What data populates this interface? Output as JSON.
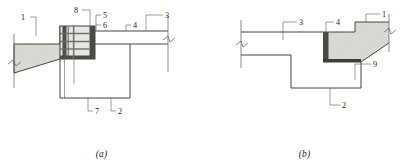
{
  "figures": [
    {
      "id": "a",
      "caption": "(a)",
      "labels": [
        {
          "key": "1",
          "text": "1",
          "x": 31,
          "y": 33
        },
        {
          "key": "8",
          "text": "8",
          "x": 79,
          "y": 12
        },
        {
          "key": "5",
          "text": "5",
          "x": 107,
          "y": 14
        },
        {
          "key": "6",
          "text": "6",
          "x": 107,
          "y": 24
        },
        {
          "key": "4",
          "text": "4",
          "x": 137,
          "y": 23
        },
        {
          "key": "3",
          "text": "3",
          "x": 169,
          "y": 13
        },
        {
          "key": "7",
          "text": "7",
          "x": 99,
          "y": 110
        },
        {
          "key": "2",
          "text": "2",
          "x": 122,
          "y": 110
        }
      ]
    },
    {
      "id": "b",
      "caption": "(b)",
      "labels": [
        {
          "key": "3",
          "text": "3",
          "x": 99,
          "y": 21
        },
        {
          "key": "4",
          "text": "4",
          "x": 135,
          "y": 23
        },
        {
          "key": "1",
          "text": "1",
          "x": 181,
          "y": 12
        },
        {
          "key": "9",
          "text": "9",
          "x": 172,
          "y": 63
        },
        {
          "key": "2",
          "text": "2",
          "x": 143,
          "y": 104
        }
      ]
    }
  ],
  "legend": {
    "item_1": "1",
    "item_2": "2",
    "item_3": "3",
    "item_4": "4",
    "item_5": "5",
    "item_6": "6",
    "item_7": "7",
    "item_8": "8",
    "item_9": "9"
  },
  "style": {
    "line_color": "#303030",
    "thin_line_color": "#5a5a5a",
    "hatch_fill": "#d8d8d4",
    "dark_band": "#4a4a4a",
    "text_color": "#1d1d1d"
  },
  "diagram_a": {
    "type": "section-detail",
    "slab_top_y": 31,
    "slab_bottom_y": 44,
    "box": {
      "x": 60,
      "y": 26,
      "w": 35,
      "h": 33
    },
    "break_marks": 2,
    "step_profile": [
      [
        60,
        59
      ],
      [
        60,
        98
      ],
      [
        130,
        98
      ],
      [
        130,
        44
      ],
      [
        168,
        44
      ]
    ]
  },
  "diagram_b": {
    "type": "section-detail",
    "slab_top_y": 32,
    "slab_bottom_y": 55,
    "wedge": [
      [
        154,
        32
      ],
      [
        181,
        32
      ],
      [
        181,
        16
      ],
      [
        203,
        16
      ],
      [
        203,
        40
      ],
      [
        168,
        62
      ],
      [
        154,
        62
      ]
    ],
    "break_marks": 2,
    "step_profile": [
      [
        60,
        32
      ],
      [
        60,
        55
      ],
      [
        97,
        55
      ],
      [
        97,
        88
      ],
      [
        154,
        88
      ],
      [
        154,
        62
      ]
    ]
  }
}
